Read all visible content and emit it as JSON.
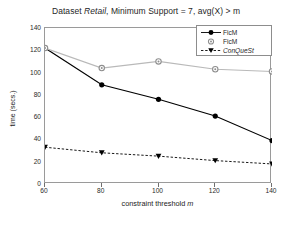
{
  "chart_data": {
    "type": "line",
    "title": "Dataset Retail, Minimum Support = 7, avg(X) > m",
    "title_parts": {
      "pre": "Dataset ",
      "italic": "Retail",
      "post": ", Minimum Support = 7, avg(X) > m"
    },
    "xlabel": "constraint threshold m",
    "xlabel_parts": {
      "text": "constraint threshold ",
      "italic": "m"
    },
    "ylabel": "time (secs.)",
    "x": [
      60,
      80,
      100,
      120,
      140
    ],
    "xlim": [
      60,
      140
    ],
    "ylim": [
      0,
      140
    ],
    "xticks": [
      "60",
      "80",
      "100",
      "120",
      "140"
    ],
    "yticks": [
      "0",
      "20",
      "40",
      "60",
      "80",
      "100",
      "120",
      "140"
    ],
    "grid": false,
    "legend_position": "upper-right",
    "series": [
      {
        "name": "FicM",
        "style": "solid",
        "marker": "filled-circle",
        "color": "#000000",
        "italic": false,
        "values": [
          122,
          89,
          76,
          61,
          39
        ]
      },
      {
        "name": "FicM",
        "style": "solid-light",
        "marker": "open-circle",
        "color": "#b9b9b9",
        "italic": false,
        "values": [
          122,
          104,
          110,
          103,
          101
        ]
      },
      {
        "name": "ConQueSt",
        "style": "dashed",
        "marker": "filled-triangle-down",
        "color": "#000000",
        "italic": true,
        "values": [
          33,
          28,
          25,
          21,
          18
        ]
      }
    ]
  }
}
